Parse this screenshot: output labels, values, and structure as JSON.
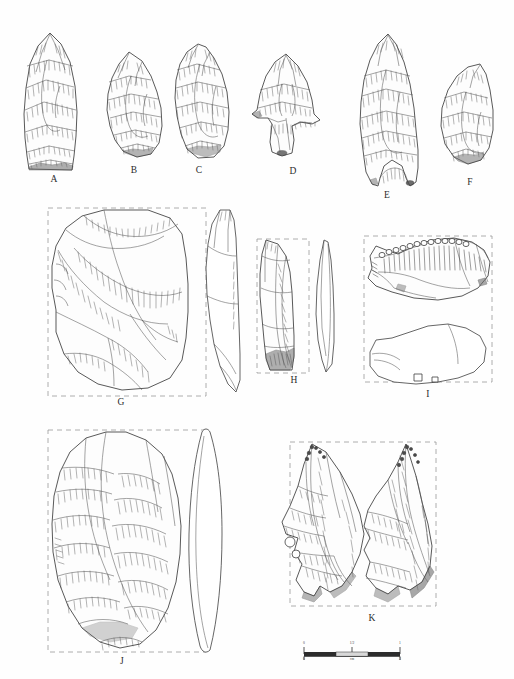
{
  "figure": {
    "type": "archaeological-lithic-plate",
    "background_color": "#fefefe",
    "ink_color": "#3b3b3b",
    "dash_color": "#9a9a9a",
    "width": 514,
    "height": 679
  },
  "artifacts": [
    {
      "id": "A",
      "label": "A",
      "label_x": 54,
      "label_y": 180,
      "description": "elongated triangular biface point with straight base, invasive parallel flake scars",
      "views": 1,
      "has_dashed_box": false
    },
    {
      "id": "B",
      "label": "B",
      "label_x": 134,
      "label_y": 171,
      "description": "irregular bifacial fragment with stepped flake scars",
      "views": 1,
      "has_dashed_box": false
    },
    {
      "id": "C",
      "label": "C",
      "label_x": 199,
      "label_y": 171,
      "description": "sub-triangular biface fragment with broad flake scars",
      "views": 1,
      "has_dashed_box": false
    },
    {
      "id": "D",
      "label": "D",
      "label_x": 293,
      "label_y": 172,
      "description": "stemmed tanged point with flaring shoulders and square stem",
      "views": 1,
      "has_dashed_box": false
    },
    {
      "id": "E",
      "label": "E",
      "label_x": 387,
      "label_y": 196,
      "description": "large fluted lanceolate point with deeply concave basal indentation",
      "views": 1,
      "has_dashed_box": false
    },
    {
      "id": "F",
      "label": "F",
      "label_x": 470,
      "label_y": 183,
      "description": "teardrop / ovate biface with rounded base",
      "views": 1,
      "has_dashed_box": false
    },
    {
      "id": "G",
      "label": "G",
      "label_x": 121,
      "label_y": 403,
      "description": "large cortical flake / side scraper, dorsal face with radial scars plus lateral profile",
      "views": 2,
      "has_dashed_box": true
    },
    {
      "id": "H",
      "label": "H",
      "label_x": 294,
      "label_y": 381,
      "description": "narrow retouched blade with steep distal end plus lateral profile",
      "views": 2,
      "has_dashed_box": true
    },
    {
      "id": "I",
      "label": "I",
      "label_x": 428,
      "label_y": 395,
      "description": "notched denticulate scraper, dorsal view with dense retouch on concave edge plus ventral outline",
      "views": 2,
      "has_dashed_box": true
    },
    {
      "id": "J",
      "label": "J",
      "label_x": 122,
      "label_y": 662,
      "description": "large ovate handaxe / biface, full-face view plus thin lenticular profile",
      "views": 2,
      "has_dashed_box": true
    },
    {
      "id": "K",
      "label": "K",
      "label_x": 372,
      "label_y": 619,
      "description": "pointed bifacial tool shown in dorsal and ventral views",
      "views": 2,
      "has_dashed_box": true
    }
  ],
  "scale_bar": {
    "x": 302,
    "y": 648,
    "length_px": 98,
    "unit_label": "cm",
    "top_ticks": [
      "0",
      "1/2",
      "1"
    ],
    "bottom_ticks": [
      "0",
      "3"
    ],
    "bar_fill_dark": "#2c2c2c",
    "bar_fill_light": "#d8d8d8"
  }
}
